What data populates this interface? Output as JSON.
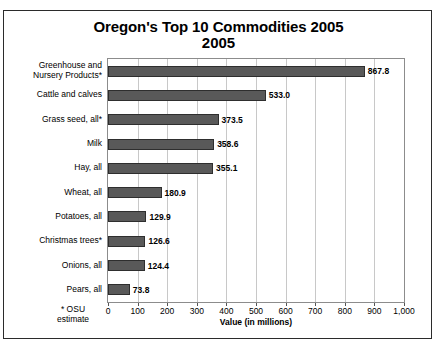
{
  "figure": {
    "title_main": "Oregon's Top 10 Commodities",
    "title_sub": "2005",
    "footnote": "* OSU\nestimate",
    "bar_color": "#595959",
    "bar_border_color": "#2e2e2e",
    "grid_color": "#c8c8c8",
    "frame_color": "#2b2b2b"
  },
  "chart_data": {
    "type": "bar",
    "orientation": "horizontal",
    "title": "Oregon's Top 10 Commodities 2005",
    "subtitle": "2005",
    "xlabel": "Value (in millions)",
    "ylabel": "",
    "xlim": [
      0,
      1000
    ],
    "xticks": [
      0,
      100,
      200,
      300,
      400,
      500,
      600,
      700,
      800,
      900,
      1000
    ],
    "xtick_labels": [
      "0",
      "100",
      "200",
      "300",
      "400",
      "500",
      "600",
      "700",
      "800",
      "900",
      "1,000"
    ],
    "grid": "vertical",
    "legend": "none",
    "categories": [
      "Greenhouse and\nNursery Products*",
      "Cattle and calves",
      "Grass seed, all*",
      "Milk",
      "Hay, all",
      "Wheat, all",
      "Potatoes, all",
      "Christmas trees*",
      "Onions, all",
      "Pears, all"
    ],
    "values": [
      867.8,
      533.0,
      373.5,
      358.6,
      355.1,
      180.9,
      129.9,
      126.6,
      124.4,
      73.8
    ],
    "value_labels": [
      "867.8",
      "533.0",
      "373.5",
      "358.6",
      "355.1",
      "180.9",
      "129.9",
      "126.6",
      "124.4",
      "73.8"
    ],
    "annotations": [
      "* OSU estimate"
    ]
  }
}
